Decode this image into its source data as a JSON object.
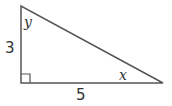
{
  "diagram": {
    "type": "right-triangle",
    "stroke_color": "#555555",
    "vertices": {
      "top": [
        21,
        6
      ],
      "right_angle": [
        21,
        83
      ],
      "right": [
        163,
        83
      ]
    },
    "labels": {
      "vertical_leg": "3",
      "horizontal_leg": "5",
      "angle_top": "y",
      "angle_right": "x"
    },
    "right_angle_marker": true
  }
}
